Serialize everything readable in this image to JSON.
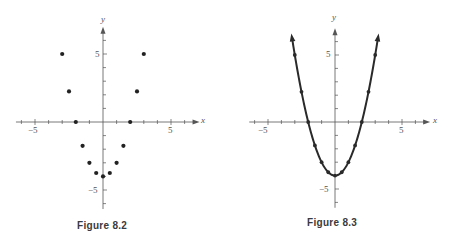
{
  "chart_data": [
    {
      "type": "scatter",
      "title": "Figure 8.2",
      "xlabel": "x",
      "ylabel": "y",
      "xlim": [
        -6.5,
        7
      ],
      "ylim": [
        -6.5,
        7
      ],
      "grid": false,
      "x_tick_labels": [
        "-5",
        "5"
      ],
      "y_tick_labels": [
        "5",
        "-5"
      ],
      "series": [
        {
          "name": "points",
          "x": [
            -3,
            -2.5,
            -2,
            -1.5,
            -1,
            -0.5,
            0,
            0.5,
            1,
            1.5,
            2,
            2.5,
            3
          ],
          "y": [
            5,
            2.25,
            0,
            -1.75,
            -3,
            -3.75,
            -4,
            -3.75,
            -3,
            -1.75,
            0,
            2.25,
            5
          ]
        }
      ]
    },
    {
      "type": "line",
      "title": "Figure 8.3",
      "xlabel": "x",
      "ylabel": "y",
      "xlim": [
        -6.5,
        7
      ],
      "ylim": [
        -6.5,
        7
      ],
      "grid": false,
      "x_tick_labels": [
        "-5",
        "5"
      ],
      "y_tick_labels": [
        "5",
        "-5"
      ],
      "series": [
        {
          "name": "y = x^2 - 4",
          "x": [
            -3,
            -2.5,
            -2,
            -1.5,
            -1,
            -0.5,
            0,
            0.5,
            1,
            1.5,
            2,
            2.5,
            3
          ],
          "y": [
            5,
            2.25,
            0,
            -1.75,
            -3,
            -3.75,
            -4,
            -3.75,
            -3,
            -1.75,
            0,
            2.25,
            5
          ],
          "markers": true,
          "arrows_at_ends": true
        }
      ]
    }
  ],
  "figures": {
    "left": {
      "caption": "Figure 8.2",
      "x_axis_label": "x",
      "y_axis_label": "y",
      "x_tick_neg": "−5",
      "x_tick_pos": "5",
      "y_tick_pos": "5",
      "y_tick_neg": "−5"
    },
    "right": {
      "caption": "Figure 8.3",
      "x_axis_label": "x",
      "y_axis_label": "y",
      "x_tick_neg": "−5",
      "x_tick_pos": "5",
      "y_tick_pos": "5",
      "y_tick_neg": "−5"
    }
  },
  "colors": {
    "axis": "#555555",
    "points": "#222222",
    "curve": "#2a2a2a",
    "caption": "#3a3a3a"
  }
}
